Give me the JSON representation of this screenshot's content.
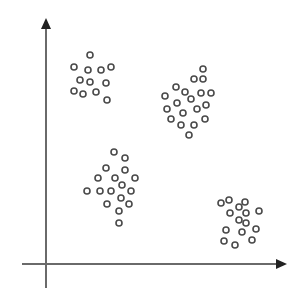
{
  "chart_data": {
    "type": "scatter",
    "title": "",
    "xlabel": "",
    "ylabel": "",
    "grid": false,
    "legend": null,
    "axes": {
      "x_axis": {
        "x1": 22,
        "y": 264,
        "x2": 287
      },
      "y_axis": {
        "x": 46,
        "y1": 288,
        "y2": 18
      },
      "color": "#6a6a6a"
    },
    "point_style": {
      "shape": "hollow-circle",
      "radius": 3,
      "stroke": "#4a4a4a"
    },
    "series": [
      {
        "name": "cluster-1",
        "points": [
          [
            90,
            55
          ],
          [
            74,
            67
          ],
          [
            88,
            70
          ],
          [
            101,
            70
          ],
          [
            111,
            67
          ],
          [
            80,
            80
          ],
          [
            90,
            82
          ],
          [
            106,
            83
          ],
          [
            74,
            91
          ],
          [
            83,
            94
          ],
          [
            96,
            92
          ],
          [
            107,
            100
          ]
        ]
      },
      {
        "name": "cluster-2",
        "points": [
          [
            203,
            69
          ],
          [
            194,
            79
          ],
          [
            203,
            79
          ],
          [
            176,
            87
          ],
          [
            185,
            92
          ],
          [
            201,
            93
          ],
          [
            211,
            93
          ],
          [
            165,
            96
          ],
          [
            191,
            99
          ],
          [
            177,
            103
          ],
          [
            206,
            105
          ],
          [
            167,
            109
          ],
          [
            197,
            109
          ],
          [
            183,
            113
          ],
          [
            171,
            119
          ],
          [
            205,
            119
          ],
          [
            181,
            125
          ],
          [
            194,
            125
          ],
          [
            189,
            135
          ]
        ]
      },
      {
        "name": "cluster-3",
        "points": [
          [
            114,
            152
          ],
          [
            125,
            158
          ],
          [
            106,
            168
          ],
          [
            125,
            170
          ],
          [
            98,
            178
          ],
          [
            115,
            178
          ],
          [
            135,
            178
          ],
          [
            122,
            185
          ],
          [
            87,
            191
          ],
          [
            100,
            191
          ],
          [
            111,
            191
          ],
          [
            131,
            191
          ],
          [
            121,
            198
          ],
          [
            107,
            204
          ],
          [
            129,
            204
          ],
          [
            119,
            211
          ],
          [
            119,
            223
          ]
        ]
      },
      {
        "name": "cluster-4",
        "points": [
          [
            221,
            203
          ],
          [
            229,
            200
          ],
          [
            245,
            202
          ],
          [
            239,
            207
          ],
          [
            230,
            213
          ],
          [
            246,
            213
          ],
          [
            259,
            211
          ],
          [
            239,
            220
          ],
          [
            246,
            223
          ],
          [
            226,
            230
          ],
          [
            242,
            232
          ],
          [
            256,
            229
          ],
          [
            224,
            241
          ],
          [
            252,
            240
          ],
          [
            235,
            245
          ]
        ]
      }
    ]
  }
}
